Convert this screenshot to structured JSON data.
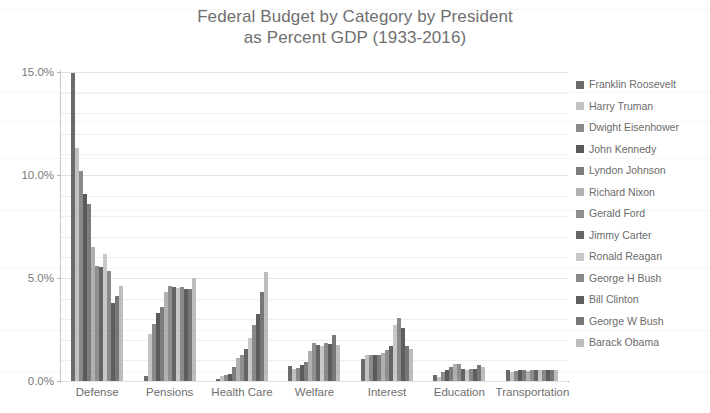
{
  "chart_data": {
    "type": "bar",
    "title": "Federal Budget by Category by President\nas Percent GDP (1933-2016)",
    "title_line1": "Federal Budget by Category by President",
    "title_line2": "as Percent GDP (1933-2016)",
    "xlabel": "",
    "ylabel": "",
    "ylim": [
      0,
      15
    ],
    "ytick_labels": [
      "0.0%",
      "5.0%",
      "10.0%",
      "15.0%"
    ],
    "ytick_values": [
      0,
      5,
      10,
      15
    ],
    "grid": true,
    "legend_position": "right",
    "categories": [
      "Defense",
      "Pensions",
      "Health Care",
      "Welfare",
      "Interest",
      "Education",
      "Transportation"
    ],
    "series": [
      {
        "name": "Franklin Roosevelt",
        "color": "#6b6b6b",
        "values": [
          14.95,
          0.25,
          0.12,
          0.75,
          1.05,
          0.3,
          0.55
        ]
      },
      {
        "name": "Harry Truman",
        "color": "#c2c2c2",
        "values": [
          11.3,
          2.3,
          0.25,
          0.6,
          1.25,
          0.2,
          0.45
        ]
      },
      {
        "name": "Dwight Eisenhower",
        "color": "#8a8a8a",
        "values": [
          10.2,
          2.75,
          0.3,
          0.65,
          1.25,
          0.45,
          0.5
        ]
      },
      {
        "name": "John Kennedy",
        "color": "#5a5a5a",
        "values": [
          9.1,
          3.3,
          0.35,
          0.8,
          1.25,
          0.55,
          0.55
        ]
      },
      {
        "name": "Lyndon Johnson",
        "color": "#7d7d7d",
        "values": [
          8.6,
          3.6,
          0.7,
          0.9,
          1.25,
          0.7,
          0.55
        ]
      },
      {
        "name": "Richard Nixon",
        "color": "#b0b0b0",
        "values": [
          6.5,
          4.3,
          1.1,
          1.45,
          1.35,
          0.85,
          0.5
        ]
      },
      {
        "name": "Gerald Ford",
        "color": "#8f8f8f",
        "values": [
          5.6,
          4.6,
          1.25,
          1.85,
          1.5,
          0.85,
          0.55
        ]
      },
      {
        "name": "Jimmy Carter",
        "color": "#656565",
        "values": [
          5.55,
          4.55,
          1.55,
          1.75,
          1.7,
          0.6,
          0.55
        ]
      },
      {
        "name": "Ronald Reagan",
        "color": "#c8c8c8",
        "values": [
          6.15,
          4.5,
          2.1,
          1.7,
          2.7,
          0.55,
          0.55
        ]
      },
      {
        "name": "George H Bush",
        "color": "#8a8a8a",
        "values": [
          5.35,
          4.55,
          2.7,
          1.85,
          3.05,
          0.6,
          0.55
        ]
      },
      {
        "name": "Bill Clinton",
        "color": "#5e5e5e",
        "values": [
          3.8,
          4.45,
          3.25,
          1.8,
          2.55,
          0.6,
          0.55
        ]
      },
      {
        "name": "George W Bush",
        "color": "#777777",
        "values": [
          4.15,
          4.45,
          4.3,
          2.25,
          1.7,
          0.8,
          0.55
        ]
      },
      {
        "name": "Barack Obama",
        "color": "#bdbdbd",
        "values": [
          4.6,
          5.0,
          5.3,
          1.75,
          1.55,
          0.7,
          0.55
        ]
      }
    ]
  }
}
